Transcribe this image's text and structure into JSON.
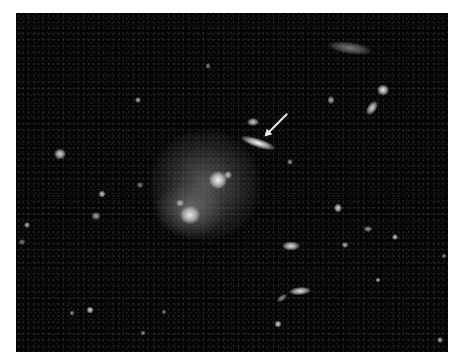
{
  "image": {
    "description": "Deep-field telescope image of a galaxy cluster; diffuse central galaxy group with an arrow pointing to an elongated edge-on galaxy",
    "background_color": "#050505",
    "frame": {
      "x": 16,
      "y": 13,
      "width": 432,
      "height": 339
    }
  },
  "annotation": {
    "type": "arrow",
    "color": "#e8e8e8",
    "start": [
      287,
      113
    ],
    "end": [
      266,
      134
    ],
    "target": "edge-on elongated galaxy"
  },
  "halos": [
    {
      "name": "central-cluster-halo",
      "x": 205,
      "y": 185,
      "w": 110,
      "h": 110
    },
    {
      "name": "lower-halo",
      "x": 190,
      "y": 210,
      "w": 70,
      "h": 55
    }
  ],
  "objects": [
    {
      "name": "edge-on-galaxy",
      "x": 258,
      "y": 143,
      "w": 36,
      "h": 9,
      "rot": 18,
      "b": 0.98
    },
    {
      "name": "galaxy-above-arrow",
      "x": 253,
      "y": 122,
      "w": 12,
      "h": 8,
      "rot": 0,
      "b": 0.8
    },
    {
      "name": "central-core",
      "x": 218,
      "y": 180,
      "w": 18,
      "h": 18,
      "rot": 0,
      "b": 0.95
    },
    {
      "name": "central-knot",
      "x": 228,
      "y": 175,
      "w": 8,
      "h": 8,
      "rot": 0,
      "b": 0.75
    },
    {
      "name": "lower-core",
      "x": 190,
      "y": 215,
      "w": 20,
      "h": 18,
      "rot": 0,
      "b": 0.9
    },
    {
      "name": "lower-knot",
      "x": 180,
      "y": 203,
      "w": 8,
      "h": 7,
      "rot": 0,
      "b": 0.7
    },
    {
      "name": "diffuse-top-right",
      "x": 350,
      "y": 48,
      "w": 44,
      "h": 12,
      "rot": 8,
      "b": 0.45
    },
    {
      "name": "bright-tr-1",
      "x": 383,
      "y": 90,
      "w": 12,
      "h": 11,
      "rot": 0,
      "b": 0.92
    },
    {
      "name": "bright-tr-2",
      "x": 372,
      "y": 108,
      "w": 9,
      "h": 16,
      "rot": 35,
      "b": 0.85
    },
    {
      "name": "tr-small",
      "x": 331,
      "y": 100,
      "w": 7,
      "h": 8,
      "rot": 0,
      "b": 0.7
    },
    {
      "name": "left-galaxy",
      "x": 60,
      "y": 154,
      "w": 12,
      "h": 11,
      "rot": 0,
      "b": 0.85
    },
    {
      "name": "left-small-1",
      "x": 138,
      "y": 100,
      "w": 6,
      "h": 6,
      "rot": 0,
      "b": 0.7
    },
    {
      "name": "left-small-2",
      "x": 102,
      "y": 194,
      "w": 7,
      "h": 7,
      "rot": 0,
      "b": 0.8
    },
    {
      "name": "left-small-3",
      "x": 96,
      "y": 216,
      "w": 9,
      "h": 8,
      "rot": 0,
      "b": 0.65
    },
    {
      "name": "left-small-4",
      "x": 27,
      "y": 225,
      "w": 6,
      "h": 6,
      "rot": 0,
      "b": 0.7
    },
    {
      "name": "left-small-5",
      "x": 22,
      "y": 242,
      "w": 7,
      "h": 6,
      "rot": 0,
      "b": 0.5
    },
    {
      "name": "left-small-6",
      "x": 140,
      "y": 185,
      "w": 7,
      "h": 6,
      "rot": 0,
      "b": 0.5
    },
    {
      "name": "mid-ellipse",
      "x": 291,
      "y": 246,
      "w": 18,
      "h": 9,
      "rot": 0,
      "b": 0.88
    },
    {
      "name": "mid-right-dot",
      "x": 338,
      "y": 208,
      "w": 8,
      "h": 9,
      "rot": 0,
      "b": 0.85
    },
    {
      "name": "mid-right-dot-2",
      "x": 345,
      "y": 245,
      "w": 7,
      "h": 6,
      "rot": 0,
      "b": 0.7
    },
    {
      "name": "right-small-1",
      "x": 368,
      "y": 229,
      "w": 9,
      "h": 6,
      "rot": 0,
      "b": 0.6
    },
    {
      "name": "right-small-2",
      "x": 395,
      "y": 237,
      "w": 6,
      "h": 6,
      "rot": 0,
      "b": 0.8
    },
    {
      "name": "right-small-3",
      "x": 378,
      "y": 280,
      "w": 5,
      "h": 5,
      "rot": 0,
      "b": 0.7
    },
    {
      "name": "lower-galaxy",
      "x": 300,
      "y": 291,
      "w": 22,
      "h": 8,
      "rot": -5,
      "b": 0.88
    },
    {
      "name": "lower-galaxy-tail",
      "x": 282,
      "y": 298,
      "w": 12,
      "h": 6,
      "rot": -35,
      "b": 0.55
    },
    {
      "name": "bottom-dot-1",
      "x": 278,
      "y": 324,
      "w": 7,
      "h": 7,
      "rot": 0,
      "b": 0.85
    },
    {
      "name": "bottom-dot-2",
      "x": 90,
      "y": 310,
      "w": 7,
      "h": 7,
      "rot": 0,
      "b": 0.85
    },
    {
      "name": "bottom-dot-3",
      "x": 72,
      "y": 313,
      "w": 5,
      "h": 5,
      "rot": 0,
      "b": 0.6
    },
    {
      "name": "bottom-dot-4",
      "x": 143,
      "y": 333,
      "w": 5,
      "h": 5,
      "rot": 0,
      "b": 0.6
    },
    {
      "name": "bottom-dot-5",
      "x": 164,
      "y": 312,
      "w": 5,
      "h": 5,
      "rot": 0,
      "b": 0.5
    },
    {
      "name": "bottom-right-dot",
      "x": 440,
      "y": 340,
      "w": 6,
      "h": 6,
      "rot": 0,
      "b": 0.7
    },
    {
      "name": "top-mid-dot",
      "x": 208,
      "y": 66,
      "w": 5,
      "h": 6,
      "rot": 0,
      "b": 0.55
    },
    {
      "name": "upper-dot",
      "x": 290,
      "y": 162,
      "w": 6,
      "h": 6,
      "rot": 0,
      "b": 0.6
    },
    {
      "name": "right-edge-dot",
      "x": 444,
      "y": 256,
      "w": 5,
      "h": 5,
      "rot": 0,
      "b": 0.55
    }
  ]
}
